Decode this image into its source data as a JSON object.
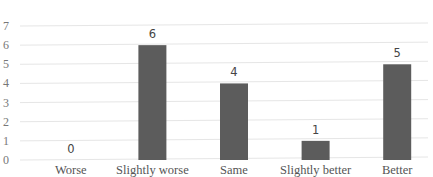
{
  "chart_data": {
    "type": "bar",
    "title": "",
    "xlabel": "",
    "ylabel": "",
    "categories": [
      "Worse",
      "Slightly worse",
      "Same",
      "Slightly better",
      "Better"
    ],
    "values": [
      0,
      6,
      4,
      1,
      5
    ],
    "data_labels": [
      "0",
      "6",
      "4",
      "1",
      "5"
    ],
    "ylim": [
      0,
      7
    ],
    "yticks": [
      0,
      1,
      2,
      3,
      4,
      5,
      6,
      7
    ],
    "ytick_labels": [
      "0",
      "1",
      "2",
      "3",
      "4",
      "5",
      "6",
      "7"
    ],
    "grid": true,
    "legend": "none",
    "colors": {
      "bar": "#5c5c5c",
      "grid": "#e6e6e6"
    }
  }
}
